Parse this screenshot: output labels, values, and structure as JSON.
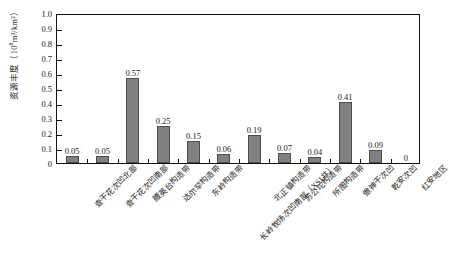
{
  "chart_data": {
    "type": "bar",
    "title": "",
    "xlabel": "",
    "ylabel": "资源丰度（10⁸m³/km²）",
    "ylabel_parts": {
      "name": "资源丰度（10",
      "exponent": "8",
      "unit_tail": "m³/km²）"
    },
    "ylim": [
      0,
      1.0
    ],
    "yticks": [
      0,
      0.1,
      0.2,
      0.3,
      0.4,
      0.5,
      0.6,
      0.7,
      0.8,
      0.9,
      1.0
    ],
    "ytick_labels": [
      "0",
      "0.1",
      "0.2",
      "0.3",
      "0.4",
      "0.5",
      "0.6",
      "0.7",
      "0.8",
      "0.9",
      "1.0"
    ],
    "grid": false,
    "legend": false,
    "bar_color": "#808080",
    "bar_edge_color": "#4d4d4d",
    "axis_color": "#111111",
    "categories": [
      "查干花次凹北部",
      "查干花次凹南部",
      "腰英台构造带",
      "达尔罕构造带",
      "东岭构造带",
      "长岭牧场次凹南部（XS1井）",
      "北正镇构造带",
      "苏公坨构造带",
      "所图构造带",
      "傲神干次凹",
      "乾安次凹",
      "红安地区"
    ],
    "values": [
      0.05,
      0.05,
      0.57,
      0.25,
      0.15,
      0.06,
      0.19,
      0.07,
      0.04,
      0.41,
      0.09,
      0
    ],
    "value_labels": [
      "0.05",
      "0.05",
      "0.57",
      "0.25",
      "0.15",
      "0.06",
      "0.19",
      "0.07",
      "0.04",
      "0.41",
      "0.09",
      "0"
    ]
  }
}
